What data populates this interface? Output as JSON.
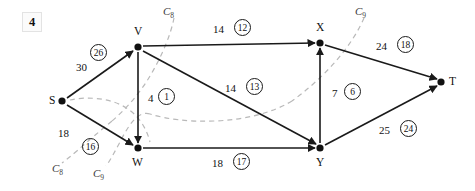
{
  "figure": {
    "number": "4"
  },
  "graph": {
    "nodes": [
      {
        "id": "S",
        "label": "S",
        "x": 62,
        "y": 101,
        "label_dx": -13,
        "label_dy": -6
      },
      {
        "id": "V",
        "label": "V",
        "x": 138,
        "y": 47,
        "label_dx": -4,
        "label_dy": -21
      },
      {
        "id": "W",
        "label": "W",
        "x": 138,
        "y": 148,
        "label_dx": -6,
        "label_dy": 9
      },
      {
        "id": "X",
        "label": "X",
        "x": 320,
        "y": 43,
        "label_dx": -4,
        "label_dy": -21
      },
      {
        "id": "Y",
        "label": "Y",
        "x": 320,
        "y": 148,
        "label_dx": -4,
        "label_dy": 9
      },
      {
        "id": "T",
        "label": "T",
        "x": 441,
        "y": 82,
        "label_dx": 8,
        "label_dy": -6
      }
    ],
    "edges": [
      {
        "from": "S",
        "to": "V",
        "capacity": "30",
        "flow": "26",
        "cap_x": 78,
        "cap_y": 67,
        "flow_x": 92,
        "flow_y": 48
      },
      {
        "from": "S",
        "to": "W",
        "capacity": "18",
        "flow": "16",
        "cap_x": 80,
        "cap_y": 129,
        "flow_x": 95,
        "flow_y": 135
      },
      {
        "from": "V",
        "to": "X",
        "capacity": "14",
        "flow": "12",
        "cap_x": 212,
        "cap_y": 28,
        "flow_x": 233,
        "flow_y": 22
      },
      {
        "from": "V",
        "to": "W",
        "capacity": "4",
        "flow": "1",
        "cap_x": 148,
        "cap_y": 92,
        "flow_x": 157,
        "flow_y": 86
      },
      {
        "from": "V",
        "to": "Y",
        "capacity": "14",
        "flow": "13",
        "cap_x": 228,
        "cap_y": 84,
        "flow_x": 246,
        "flow_y": 78
      },
      {
        "from": "W",
        "to": "Y",
        "capacity": "18",
        "flow": "17",
        "cap_x": 212,
        "cap_y": 158,
        "flow_x": 232,
        "flow_y": 152
      },
      {
        "from": "Y",
        "to": "X",
        "capacity": "7",
        "flow": "6",
        "cap_x": 330,
        "cap_y": 89,
        "flow_x": 341,
        "flow_y": 83
      },
      {
        "from": "X",
        "to": "T",
        "capacity": "24",
        "flow": "18",
        "cap_x": 376,
        "cap_y": 43,
        "flow_x": 396,
        "flow_y": 37
      },
      {
        "from": "Y",
        "to": "T",
        "capacity": "25",
        "flow": "24",
        "cap_x": 379,
        "cap_y": 127,
        "flow_x": 399,
        "flow_y": 121
      }
    ],
    "cuts": [
      {
        "id": "C8",
        "name": "C",
        "subscript": "8",
        "top_label_x": 166,
        "top_label_y": 8,
        "bottom_label_x": 55,
        "bottom_label_y": 166
      },
      {
        "id": "C9",
        "name": "C",
        "subscript": "9",
        "top_label_x": 357,
        "top_label_y": 8,
        "bottom_label_x": 96,
        "bottom_label_y": 171
      }
    ]
  },
  "colors": {
    "edge": "#1a1a1a",
    "node": "#111111",
    "cut": "#b9b9b9",
    "background": "#ffffff",
    "text": "#111111"
  }
}
